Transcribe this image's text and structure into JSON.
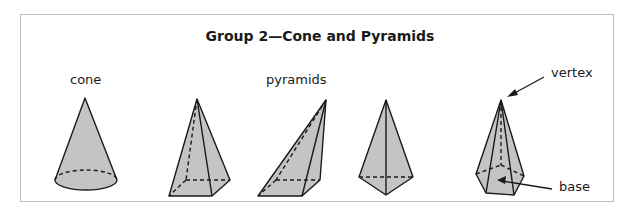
{
  "title": "Group 2—Cone and Pyramids",
  "labels": {
    "cone": "cone",
    "pyramids": "pyramids",
    "vertex": "vertex",
    "base": "base"
  },
  "shapes": [
    {
      "name": "cone",
      "kind": "cone"
    },
    {
      "name": "square-pyramid",
      "kind": "pyramid"
    },
    {
      "name": "oblique-pyramid",
      "kind": "pyramid"
    },
    {
      "name": "triangular-pyramid",
      "kind": "pyramid"
    },
    {
      "name": "pentagonal-pyramid",
      "kind": "pyramid"
    }
  ],
  "colors": {
    "fill": "#c4c4c4",
    "stroke": "#1a1a1a",
    "border": "#bdbdbd"
  }
}
